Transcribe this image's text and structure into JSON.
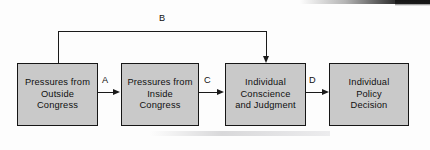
{
  "diagram": {
    "background_color": "#fdfdfd",
    "node_fill_color": "#c9c9c9",
    "node_border_color": "#161616",
    "connector_color": "#1a1a1a",
    "nodes": [
      {
        "id": "outside",
        "label": "Pressures from\nOutside\nCongress"
      },
      {
        "id": "inside",
        "label": "Pressures from\nInside\nCongress"
      },
      {
        "id": "conscience",
        "label": "Individual\nConscience\nand Judgment"
      },
      {
        "id": "decision",
        "label": "Individual\nPolicy\nDecision"
      }
    ],
    "edges": [
      {
        "id": "a",
        "label": "A",
        "from": "outside",
        "to": "inside"
      },
      {
        "id": "b",
        "label": "B",
        "from": "outside",
        "to": "conscience"
      },
      {
        "id": "c",
        "label": "C",
        "from": "inside",
        "to": "conscience"
      },
      {
        "id": "d",
        "label": "D",
        "from": "conscience",
        "to": "decision"
      }
    ]
  }
}
